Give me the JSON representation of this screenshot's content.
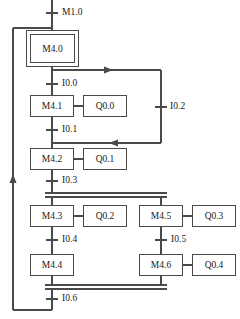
{
  "diagram": {
    "type": "sequential-function-chart",
    "line_color": "#4a4a4a",
    "text_color": "#1a1a1a",
    "background": "#ffffff",
    "initial_step": {
      "label": "M4.0"
    },
    "transitions": [
      {
        "id": "t0",
        "label": "M1.0"
      },
      {
        "id": "t1",
        "label": "I0.0"
      },
      {
        "id": "t2",
        "label": "I0.1"
      },
      {
        "id": "t3",
        "label": "I0.2"
      },
      {
        "id": "t4",
        "label": "I0.3"
      },
      {
        "id": "t5",
        "label": "I0.4"
      },
      {
        "id": "t6",
        "label": "I0.5"
      },
      {
        "id": "t7",
        "label": "I0.6"
      }
    ],
    "steps": [
      {
        "id": "s0",
        "label": "M4.0",
        "action": null
      },
      {
        "id": "s1",
        "label": "M4.1",
        "action": "Q0.0"
      },
      {
        "id": "s2",
        "label": "M4.2",
        "action": "Q0.1"
      },
      {
        "id": "s3",
        "label": "M4.3",
        "action": "Q0.2"
      },
      {
        "id": "s4",
        "label": "M4.4",
        "action": null
      },
      {
        "id": "s5",
        "label": "M4.5",
        "action": "Q0.3"
      },
      {
        "id": "s6",
        "label": "M4.6",
        "action": "Q0.4"
      }
    ],
    "actions": [
      {
        "id": "a0",
        "label": "Q0.0"
      },
      {
        "id": "a1",
        "label": "Q0.1"
      },
      {
        "id": "a2",
        "label": "Q0.2"
      },
      {
        "id": "a3",
        "label": "Q0.3"
      },
      {
        "id": "a4",
        "label": "Q0.4"
      }
    ]
  }
}
